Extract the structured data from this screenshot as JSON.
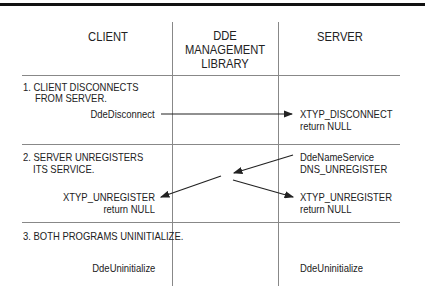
{
  "headers": {
    "client": "CLIENT",
    "ddeml_line1": "DDE",
    "ddeml_line2": "MANAGEMENT",
    "ddeml_line3": "LIBRARY",
    "server": "SERVER"
  },
  "steps": [
    {
      "title_line1": "1. CLIENT DISCONNECTS",
      "title_line2": "FROM SERVER.",
      "client_call": "DdeDisconnect",
      "server_line1": "XTYP_DISCONNECT",
      "server_line2": "return NULL"
    },
    {
      "title_line1": "2. SERVER UNREGISTERS",
      "title_line2": "ITS SERVICE.",
      "server_call_line1": "DdeNameService",
      "server_call_line2": "DNS_UNREGISTER",
      "client_line1": "XTYP_UNREGISTER",
      "client_line2": "return NULL",
      "server_line1": "XTYP_UNREGISTER",
      "server_line2": "return NULL"
    },
    {
      "title_line1": "3. BOTH PROGRAMS UNINITIALIZE.",
      "client_call": "DdeUninitialize",
      "server_call": "DdeUninitialize"
    }
  ],
  "colors": {
    "text": "#222222",
    "lines": "#888888",
    "topbar": "#111111"
  }
}
